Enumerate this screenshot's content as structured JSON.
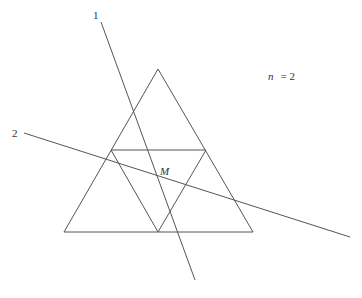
{
  "diagram": {
    "title_annotation": "n = 2",
    "n_label": "n",
    "n_eq": "= 2",
    "point_label": "M",
    "line_labels": [
      "1",
      "2"
    ],
    "stroke_color": "#555555",
    "outer_triangle": {
      "apex": [
        158,
        69
      ],
      "left": [
        64,
        232
      ],
      "right": [
        253,
        232
      ]
    },
    "inner_triangle": {
      "top_left": [
        111,
        150
      ],
      "top_right": [
        206,
        150
      ],
      "bottom": [
        158,
        232
      ]
    },
    "line_1": {
      "from": [
        101,
        22
      ],
      "to": [
        195,
        280
      ]
    },
    "line_2": {
      "from": [
        24,
        133
      ],
      "to": [
        350,
        237
      ]
    }
  }
}
